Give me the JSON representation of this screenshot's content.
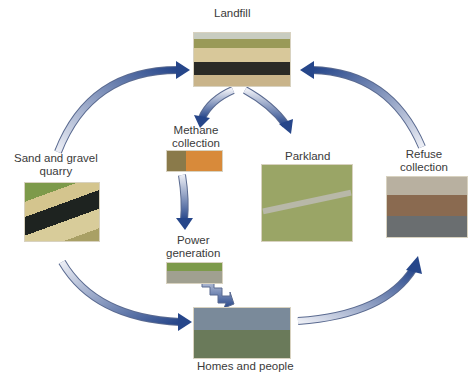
{
  "diagram": {
    "nodes": [
      {
        "id": "landfill",
        "label": "Landfill"
      },
      {
        "id": "quarry",
        "label": "Sand and gravel\nquarry"
      },
      {
        "id": "methane",
        "label": "Methane\ncollection"
      },
      {
        "id": "power",
        "label": "Power\ngeneration"
      },
      {
        "id": "parkland",
        "label": "Parkland"
      },
      {
        "id": "refuse",
        "label": "Refuse\ncollection"
      },
      {
        "id": "homes",
        "label": "Homes and people"
      }
    ],
    "edges": [
      {
        "from": "quarry",
        "to": "landfill"
      },
      {
        "from": "landfill",
        "to": "methane"
      },
      {
        "from": "landfill",
        "to": "parkland"
      },
      {
        "from": "methane",
        "to": "power"
      },
      {
        "from": "power",
        "to": "homes"
      },
      {
        "from": "quarry",
        "to": "homes"
      },
      {
        "from": "homes",
        "to": "refuse"
      },
      {
        "from": "refuse",
        "to": "landfill"
      }
    ],
    "colors": {
      "arrow_dark": "#2c4a8a",
      "arrow_light": "#e8eaf2"
    }
  }
}
